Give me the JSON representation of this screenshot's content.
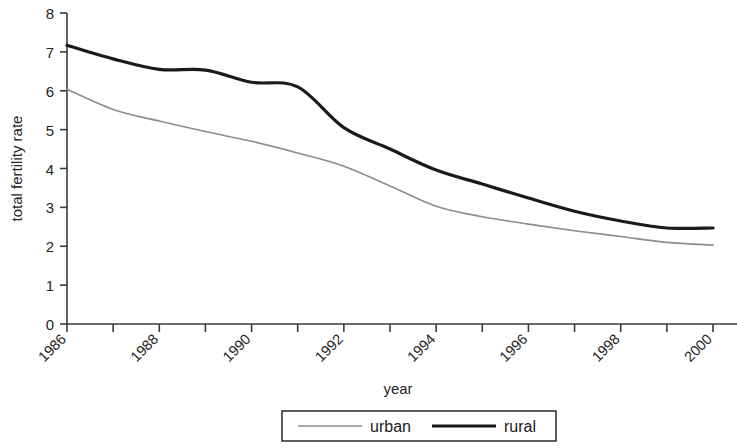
{
  "chart_data": {
    "type": "line",
    "title": "",
    "xlabel": "year",
    "ylabel": "total fertility rate",
    "xlim": [
      1986,
      2000
    ],
    "ylim": [
      0,
      8
    ],
    "ytick_step": 1,
    "xtick_step": 1,
    "xtick_label_step": 2,
    "grid": false,
    "legend_position": "bottom",
    "x": [
      1986,
      1987,
      1988,
      1989,
      1990,
      1991,
      1992,
      1993,
      1994,
      1995,
      1996,
      1997,
      1998,
      1999,
      2000
    ],
    "xticks": [
      1986,
      1987,
      1988,
      1989,
      1990,
      1991,
      1992,
      1993,
      1994,
      1995,
      1996,
      1997,
      1998,
      1999,
      2000
    ],
    "xtick_labels": [
      "1986",
      "",
      "1988",
      "",
      "1990",
      "",
      "1992",
      "",
      "1994",
      "",
      "1996",
      "",
      "1998",
      "",
      "2000"
    ],
    "yticks": [
      0,
      1,
      2,
      3,
      4,
      5,
      6,
      7,
      8
    ],
    "ytick_labels": [
      "0",
      "1",
      "2",
      "3",
      "4",
      "5",
      "6",
      "7",
      "8"
    ],
    "series": [
      {
        "name": "urban",
        "color": "#8c8c8c",
        "width": 1.6,
        "values": [
          6.04,
          5.52,
          5.22,
          4.95,
          4.7,
          4.4,
          4.06,
          3.55,
          3.03,
          2.76,
          2.57,
          2.4,
          2.25,
          2.1,
          2.03
        ]
      },
      {
        "name": "rural",
        "color": "#1a1a1a",
        "width": 3.2,
        "values": [
          7.17,
          6.82,
          6.55,
          6.53,
          6.22,
          6.1,
          5.05,
          4.5,
          3.96,
          3.6,
          3.24,
          2.9,
          2.65,
          2.47,
          2.47
        ]
      }
    ]
  },
  "legend": {
    "items": [
      {
        "label": "urban",
        "color": "#8c8c8c",
        "width": 1.6
      },
      {
        "label": "rural",
        "color": "#1a1a1a",
        "width": 3.2
      }
    ]
  },
  "axes": {
    "y_title": "total fertility rate",
    "x_title": "year"
  }
}
